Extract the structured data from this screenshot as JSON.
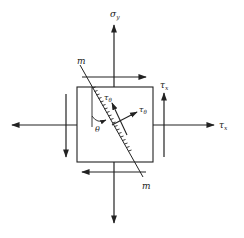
{
  "diagram": {
    "labels": {
      "sigma_y": "σ",
      "sigma_y_sub": "y",
      "tau_x_top": "τ",
      "tau_x_top_sub": "x",
      "tau_x_right": "τ",
      "tau_x_right_sub": "x",
      "plane_top": "m",
      "plane_bottom": "m",
      "theta": "θ",
      "tau_theta": "τ",
      "tau_theta_sub": "θ",
      "sigma_theta": "τ",
      "sigma_theta_sub": "θ"
    },
    "colors": {
      "stroke": "#222222",
      "background": "#ffffff"
    }
  }
}
